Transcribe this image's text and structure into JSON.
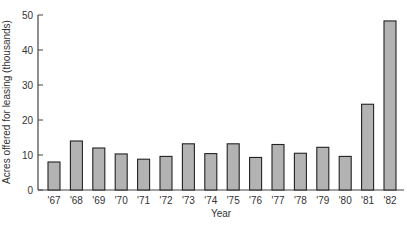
{
  "chart_data": {
    "type": "bar",
    "title": "",
    "xlabel": "Year",
    "ylabel": "Acres offered for leasing (thousands)",
    "categories": [
      "'67",
      "'68",
      "'69",
      "'70",
      "'71",
      "'72",
      "'73",
      "'74",
      "'75",
      "'76",
      "'77",
      "'78",
      "'79",
      "'80",
      "'81",
      "'82"
    ],
    "values": [
      8,
      14,
      12,
      10.3,
      8.8,
      9.6,
      13.2,
      10.4,
      13.2,
      9.3,
      13,
      10.5,
      12.2,
      9.6,
      24.5,
      48.3
    ],
    "ylim": [
      0,
      50
    ],
    "yticks": [
      0,
      10,
      20,
      30,
      40,
      50
    ],
    "grid": false,
    "legend": null,
    "colors": {
      "bar_fill": "#b3b3b3",
      "bar_stroke": "#222222",
      "axis": "#444444"
    }
  }
}
